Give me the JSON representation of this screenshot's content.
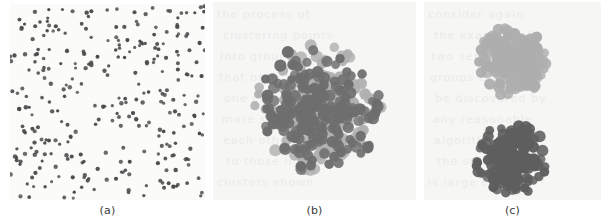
{
  "figure": {
    "background_color": "#ffffff",
    "panel_background_a": "#fbfbfa",
    "panel_background_bc": "#f6f6f5"
  },
  "captions": {
    "a": "(a)",
    "b": "(b)",
    "c": "(c)"
  },
  "chart_data": [
    {
      "type": "scatter",
      "panel": "a",
      "title": "(a)",
      "description": "Uniformly scattered points with no cluster structure",
      "xlabel": "",
      "ylabel": "",
      "grid": false,
      "legend": "none",
      "xlim": [
        0,
        195
      ],
      "ylim": [
        0,
        196
      ],
      "marker_radius": 1.9,
      "series": [
        {
          "name": "points",
          "color": "#4a4a4a",
          "n_points": 300,
          "distribution": "uniform",
          "seed": 17
        }
      ]
    },
    {
      "type": "scatter",
      "panel": "b",
      "title": "(b)",
      "description": "Two intermixed point populations forming one dense overlapping cluster",
      "xlabel": "",
      "ylabel": "",
      "grid": false,
      "legend": "none",
      "xlim": [
        0,
        203
      ],
      "ylim": [
        0,
        198
      ],
      "marker_radius": 5.2,
      "series": [
        {
          "name": "light-population",
          "color": "#b0b0b0",
          "n_points": 200,
          "distribution": "gaussian",
          "center": [
            106,
            106
          ],
          "spread": 30,
          "seed": 41
        },
        {
          "name": "dark-population",
          "color": "#6e6e6e",
          "n_points": 200,
          "distribution": "gaussian",
          "center": [
            106,
            106
          ],
          "spread": 30,
          "seed": 73
        }
      ]
    },
    {
      "type": "scatter",
      "panel": "c",
      "title": "(c)",
      "description": "Two well-separated clusters, a light cluster above a dark cluster",
      "xlabel": "",
      "ylabel": "",
      "grid": false,
      "legend": "none",
      "xlim": [
        0,
        177
      ],
      "ylim": [
        0,
        198
      ],
      "marker_radius": 5.2,
      "series": [
        {
          "name": "upper-light-cluster",
          "color": "#aeaeae",
          "n_points": 190,
          "distribution": "gaussian",
          "center": [
            88,
            58
          ],
          "spread": 17,
          "seed": 11
        },
        {
          "name": "lower-dark-cluster",
          "color": "#5e5e5e",
          "n_points": 190,
          "distribution": "gaussian",
          "center": [
            88,
            157
          ],
          "spread": 17,
          "seed": 29
        }
      ]
    }
  ],
  "bleed_text": {
    "color": "#e2e2e0",
    "lines_b": [
      "the process of",
      "clustering points",
      "into groups such",
      "that objects in",
      "one cluster are",
      "more similar to",
      "each other than",
      "to those in other",
      "clusters shown"
    ],
    "lines_c": [
      "consider again",
      "the example of",
      "two separated",
      "groups that can",
      "be discovered by",
      "any reasonable",
      "algorithm when",
      "the separation",
      "is large enough"
    ]
  }
}
